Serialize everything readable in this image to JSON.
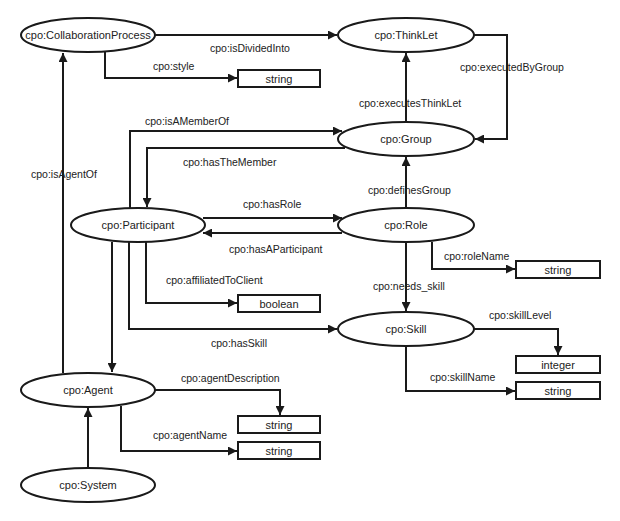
{
  "diagram": {
    "colors": {
      "stroke": "#1a1a1a",
      "fill": "#ffffff",
      "text": "#222222"
    },
    "nodes": {
      "collaboration_process": "cpo:CollaborationProcess",
      "thinklet": "cpo:ThinkLet",
      "group": "cpo:Group",
      "participant": "cpo:Participant",
      "role": "cpo:Role",
      "skill": "cpo:Skill",
      "agent": "cpo:Agent",
      "system": "cpo:System"
    },
    "literals": {
      "style_type": "string",
      "role_name_type": "string",
      "affiliated_type": "boolean",
      "skill_level_type": "integer",
      "skill_name_type": "string",
      "agent_description_type": "string",
      "agent_name_type": "string"
    },
    "edges": {
      "is_divided_into": "cpo:isDividedInto",
      "style": "cpo:style",
      "executed_by_group": "cpo:executedByGroup",
      "executes_thinklet": "cpo:executesThinkLet",
      "is_a_member_of": "cpo:isAMemberOf",
      "has_the_member": "cpo:hasTheMember",
      "is_agent_of": "cpo:isAgentOf",
      "defines_group": "cpo:definesGroup",
      "has_role": "cpo:hasRole",
      "has_a_participant": "cpo:hasAParticipant",
      "role_name": "cpo:roleName",
      "affiliated_to_client": "cpo:affiliatedToClient",
      "needs_skill": "cpo:needs_skill",
      "skill_level": "cpo:skillLevel",
      "has_skill": "cpo:hasSkill",
      "skill_name": "cpo:skillName",
      "agent_description": "cpo:agentDescription",
      "agent_name": "cpo:agentName"
    }
  }
}
